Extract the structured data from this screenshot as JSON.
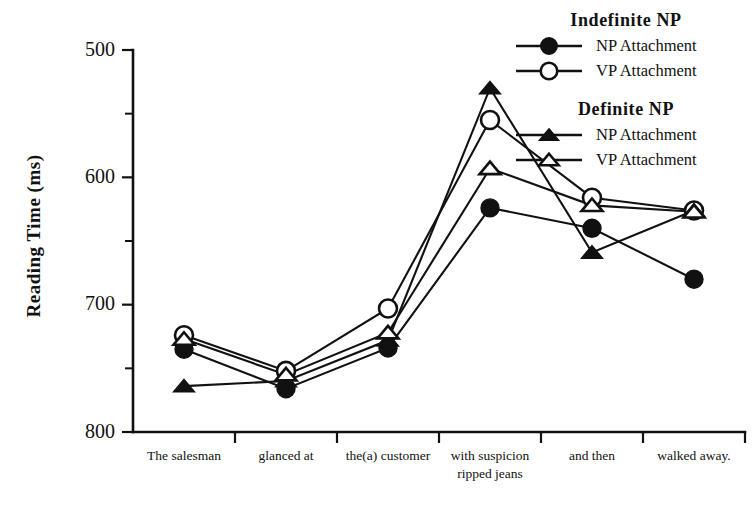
{
  "chart_data": {
    "type": "line",
    "title": "",
    "xlabel": "",
    "ylabel": "Reading Time (ms)",
    "ylim": [
      500,
      800
    ],
    "yticks": [
      500,
      600,
      700,
      800
    ],
    "yticks_minor": [
      550,
      650,
      750
    ],
    "grid": false,
    "legend_position": "top-right",
    "categories": [
      "The salesman",
      "glanced at",
      "the(a) customer",
      "with suspicion",
      "and then",
      "walked away."
    ],
    "categories_line2": [
      "",
      "",
      "",
      "ripped jeans",
      "",
      ""
    ],
    "series": [
      {
        "name": "NP Attachment",
        "group": "Indefinite NP",
        "marker": "filled-circle",
        "values": [
          565,
          534,
          566,
          676,
          660,
          620
        ]
      },
      {
        "name": "VP Attachment",
        "group": "Indefinite NP",
        "marker": "open-circle",
        "values": [
          576,
          548,
          597,
          745,
          684,
          674
        ]
      },
      {
        "name": "NP Attachment",
        "group": "Definite NP",
        "marker": "filled-triangle",
        "values": [
          536,
          540,
          572,
          770,
          641,
          674
        ]
      },
      {
        "name": "VP Attachment",
        "group": "Definite NP",
        "marker": "open-triangle",
        "values": [
          573,
          545,
          578,
          707,
          678,
          673
        ]
      }
    ]
  },
  "axis": {
    "y_title": "Reading Time  (ms)",
    "y_tick_labels": [
      "800",
      "700",
      "600",
      "500"
    ]
  },
  "legend": {
    "groups": [
      {
        "title": "Indefinite  NP",
        "entries": [
          {
            "label": "NP Attachment",
            "marker": "filled-circle"
          },
          {
            "label": "VP Attachment",
            "marker": "open-circle"
          }
        ]
      },
      {
        "title": "Definite  NP",
        "entries": [
          {
            "label": "NP Attachment",
            "marker": "filled-triangle"
          },
          {
            "label": "VP Attachment",
            "marker": "open-triangle"
          }
        ]
      }
    ]
  },
  "colors": {
    "ink": "#111111",
    "background": "#ffffff"
  }
}
